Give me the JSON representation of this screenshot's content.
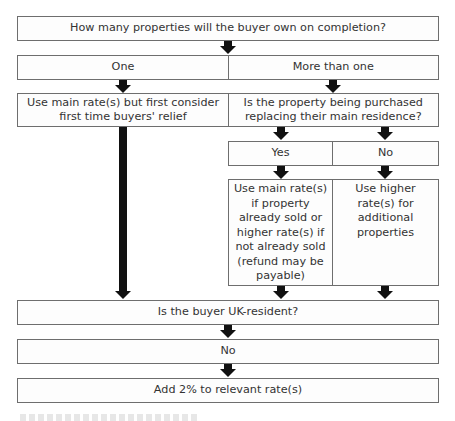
{
  "flowchart": {
    "q1": "How many properties will the buyer own on completion?",
    "q1_answers": {
      "one": "One",
      "more": "More than one"
    },
    "one_outcome": "Use main rate(s) but first consider first time buyers' relief",
    "q2": "Is the property being purchased replacing their main residence?",
    "q2_answers": {
      "yes": "Yes",
      "no": "No"
    },
    "yes_outcome": "Use main rate(s) if property already sold or higher rate(s) if not already sold (refund may be payable)",
    "no_outcome": "Use higher rate(s) for additional properties",
    "q3": "Is the buyer UK-resident?",
    "q3_answer": "No",
    "final_outcome": "Add 2% to relevant rate(s)"
  }
}
